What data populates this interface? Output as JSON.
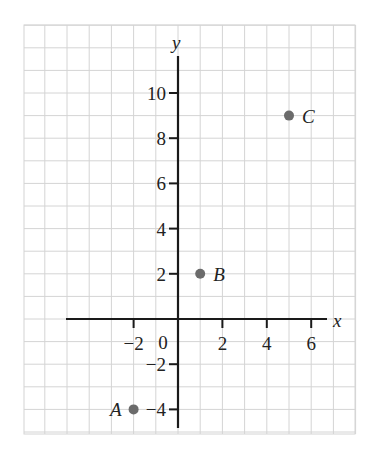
{
  "chart_data": {
    "type": "scatter",
    "title": "",
    "xlabel": "x",
    "ylabel": "y",
    "xlim": [
      -7,
      7.6
    ],
    "ylim": [
      -5,
      12.2
    ],
    "grid": true,
    "x_ticks": [
      -2,
      2,
      4,
      6
    ],
    "x_tick_labels": [
      "−2",
      "2",
      "4",
      "6"
    ],
    "y_ticks": [
      -4,
      -2,
      2,
      4,
      6,
      8,
      10
    ],
    "y_tick_labels": [
      "−4",
      "−2",
      "2",
      "4",
      "6",
      "8",
      "10"
    ],
    "origin_label": "0",
    "points": [
      {
        "label": "A",
        "x": -2,
        "y": -4
      },
      {
        "label": "B",
        "x": 1,
        "y": 2
      },
      {
        "label": "C",
        "x": 5,
        "y": 9
      }
    ],
    "colors": {
      "grid": "#d4d4d4",
      "axis": "#1a1a1a",
      "point": "#6b6b6b",
      "text": "#222222"
    }
  }
}
